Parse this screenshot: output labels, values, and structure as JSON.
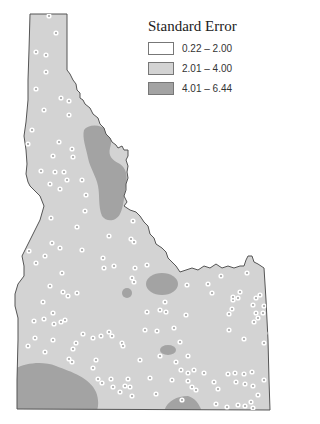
{
  "legend": {
    "title": "Standard Error",
    "items": [
      {
        "label": "0.22 – 2.00",
        "color": "#ffffff"
      },
      {
        "label": "2.01 – 4.00",
        "color": "#d3d3d3"
      },
      {
        "label": "4.01 – 6.44",
        "color": "#a3a3a3"
      }
    ]
  },
  "map": {
    "region": "Idaho",
    "base_color": "#d3d3d3",
    "high_color": "#a3a3a3",
    "border_color": "#555555",
    "station_points": [
      [
        49,
        16
      ],
      [
        56,
        33
      ],
      [
        36,
        52
      ],
      [
        46,
        55
      ],
      [
        46,
        72
      ],
      [
        36,
        89
      ],
      [
        61,
        98
      ],
      [
        69,
        101
      ],
      [
        44,
        110
      ],
      [
        69,
        115
      ],
      [
        32,
        130
      ],
      [
        59,
        142
      ],
      [
        28,
        144
      ],
      [
        72,
        149
      ],
      [
        73,
        157
      ],
      [
        53,
        156
      ],
      [
        41,
        171
      ],
      [
        55,
        172
      ],
      [
        64,
        172
      ],
      [
        67,
        180
      ],
      [
        50,
        184
      ],
      [
        60,
        189
      ],
      [
        82,
        180
      ],
      [
        86,
        195
      ],
      [
        85,
        211
      ],
      [
        51,
        218
      ],
      [
        77,
        227
      ],
      [
        52,
        243
      ],
      [
        60,
        248
      ],
      [
        45,
        256
      ],
      [
        29,
        251
      ],
      [
        36,
        263
      ],
      [
        82,
        250
      ],
      [
        103,
        258
      ],
      [
        62,
        273
      ],
      [
        133,
        221
      ],
      [
        131,
        239
      ],
      [
        134,
        242
      ],
      [
        109,
        236
      ],
      [
        135,
        268
      ],
      [
        132,
        278
      ],
      [
        134,
        282
      ],
      [
        114,
        266
      ],
      [
        104,
        268
      ],
      [
        50,
        286
      ],
      [
        63,
        292
      ],
      [
        77,
        293
      ],
      [
        68,
        296
      ],
      [
        43,
        302
      ],
      [
        53,
        313
      ],
      [
        44,
        319
      ],
      [
        65,
        320
      ],
      [
        54,
        324
      ],
      [
        34,
        321
      ],
      [
        61,
        322
      ],
      [
        35,
        338
      ],
      [
        28,
        346
      ],
      [
        53,
        340
      ],
      [
        45,
        352
      ],
      [
        69,
        359
      ],
      [
        73,
        349
      ],
      [
        83,
        334
      ],
      [
        76,
        343
      ],
      [
        109,
        332
      ],
      [
        101,
        336
      ],
      [
        112,
        336
      ],
      [
        122,
        343
      ],
      [
        123,
        346
      ],
      [
        93,
        338
      ],
      [
        72,
        362
      ],
      [
        96,
        360
      ],
      [
        93,
        368
      ],
      [
        98,
        379
      ],
      [
        111,
        379
      ],
      [
        113,
        387
      ],
      [
        128,
        379
      ],
      [
        125,
        386
      ],
      [
        130,
        387
      ],
      [
        120,
        392
      ],
      [
        102,
        383
      ],
      [
        132,
        396
      ],
      [
        147,
        265
      ],
      [
        145,
        330
      ],
      [
        150,
        378
      ],
      [
        160,
        356
      ],
      [
        165,
        302
      ],
      [
        174,
        328
      ],
      [
        180,
        342
      ],
      [
        186,
        315
      ],
      [
        188,
        356
      ],
      [
        176,
        362
      ],
      [
        181,
        370
      ],
      [
        188,
        373
      ],
      [
        188,
        381
      ],
      [
        194,
        370
      ],
      [
        192,
        387
      ],
      [
        196,
        390
      ],
      [
        204,
        373
      ],
      [
        214,
        382
      ],
      [
        218,
        389
      ],
      [
        228,
        374
      ],
      [
        235,
        373
      ],
      [
        236,
        382
      ],
      [
        244,
        374
      ],
      [
        252,
        372
      ],
      [
        245,
        384
      ],
      [
        253,
        386
      ],
      [
        258,
        395
      ],
      [
        251,
        402
      ],
      [
        216,
        404
      ],
      [
        182,
        400
      ],
      [
        172,
        380
      ],
      [
        156,
        394
      ],
      [
        140,
        360
      ],
      [
        157,
        331
      ],
      [
        147,
        312
      ],
      [
        160,
        310
      ],
      [
        166,
        312
      ],
      [
        187,
        285
      ],
      [
        212,
        293
      ],
      [
        233,
        300
      ],
      [
        238,
        298
      ],
      [
        232,
        309
      ],
      [
        229,
        314
      ],
      [
        253,
        305
      ],
      [
        256,
        313
      ],
      [
        258,
        318
      ],
      [
        264,
        306
      ],
      [
        254,
        322
      ],
      [
        247,
        273
      ],
      [
        221,
        276
      ],
      [
        208,
        284
      ],
      [
        233,
        297
      ],
      [
        240,
        292
      ],
      [
        256,
        298
      ],
      [
        260,
        295
      ],
      [
        263,
        313
      ],
      [
        229,
        330
      ],
      [
        270,
        333
      ],
      [
        244,
        339
      ],
      [
        264,
        343
      ],
      [
        245,
        406
      ],
      [
        227,
        407
      ],
      [
        238,
        405
      ],
      [
        253,
        408
      ],
      [
        264,
        380
      ]
    ]
  }
}
